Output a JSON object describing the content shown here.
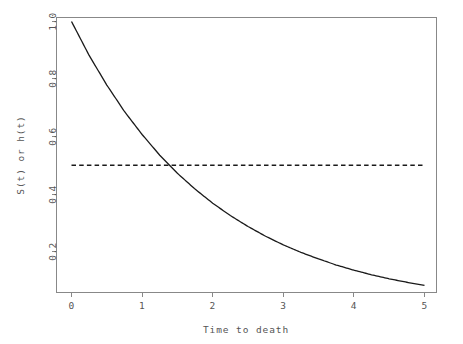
{
  "chart_data": {
    "type": "line",
    "title": "",
    "subtitle": "",
    "xlabel": "Time to death",
    "ylabel": "S(t) or h(t)",
    "xlim": [
      0,
      5
    ],
    "ylim": [
      0.06,
      1.02
    ],
    "grid": false,
    "legend": null,
    "xticks": [
      0,
      1,
      2,
      3,
      4,
      5
    ],
    "xticklabels": [
      "0",
      "1",
      "2",
      "3",
      "4",
      "5"
    ],
    "yticks": [
      0.2,
      0.4,
      0.6,
      0.8,
      1.0
    ],
    "yticklabels": [
      "0.2",
      "0.4",
      "0.6",
      "0.8",
      "1.0"
    ],
    "x": [
      0,
      0.25,
      0.5,
      0.75,
      1,
      1.25,
      1.4,
      1.5,
      1.75,
      2,
      2.25,
      2.5,
      2.75,
      3,
      3.25,
      3.5,
      3.75,
      4,
      4.25,
      4.5,
      4.75,
      5
    ],
    "series": [
      {
        "name": "S(t)",
        "style": "solid",
        "color": "#1a1a1a",
        "formula": "S(t) = exp(-0.5 t)",
        "values": [
          1.0,
          0.882,
          0.779,
          0.687,
          0.607,
          0.535,
          0.497,
          0.472,
          0.417,
          0.368,
          0.325,
          0.287,
          0.253,
          0.223,
          0.197,
          0.174,
          0.153,
          0.135,
          0.119,
          0.105,
          0.093,
          0.082
        ]
      },
      {
        "name": "h(t)",
        "style": "dashed",
        "color": "#1a1a1a",
        "formula": "h(t) = 0.5",
        "values": [
          0.5,
          0.5,
          0.5,
          0.5,
          0.5,
          0.5,
          0.5,
          0.5,
          0.5,
          0.5,
          0.5,
          0.5,
          0.5,
          0.5,
          0.5,
          0.5,
          0.5,
          0.5,
          0.5,
          0.5,
          0.5,
          0.5
        ]
      }
    ],
    "annotations": [
      {
        "name": "crossing-point",
        "x": 1.386,
        "y": 0.5,
        "label": ""
      }
    ]
  },
  "axes": {
    "x_title": "Time to death",
    "y_title": "S(t) or h(t)"
  }
}
